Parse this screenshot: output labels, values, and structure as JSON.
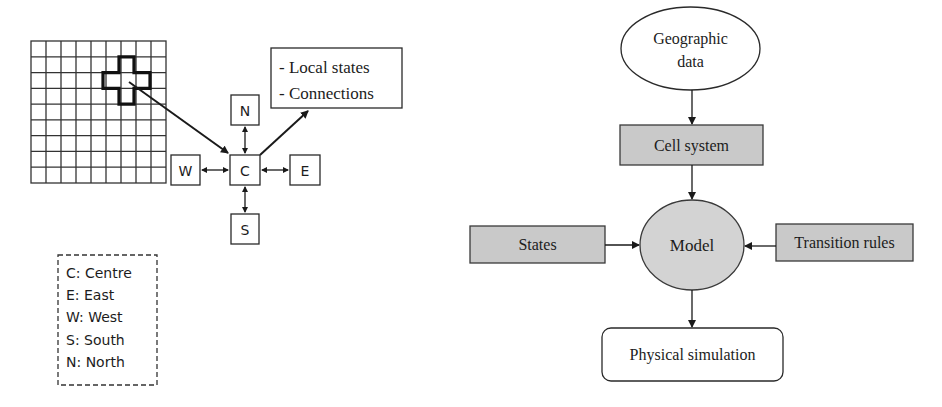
{
  "left_diagram": {
    "grid": {
      "columns": 9,
      "rows": 9,
      "highlight_center": {
        "column": 7,
        "row": 3
      },
      "highlight_shape": "plus"
    },
    "info_box": {
      "lines": [
        "- Local states",
        "- Connections"
      ]
    },
    "neighbourhood": {
      "centre": "C",
      "north": "N",
      "south": "S",
      "east": "E",
      "west": "W"
    },
    "legend": {
      "items": [
        "C: Centre",
        "E: East",
        "W: West",
        "S: South",
        "N: North"
      ]
    }
  },
  "right_diagram": {
    "nodes": {
      "geographic_data": {
        "line1": "Geographic",
        "line2": "data",
        "shape": "ellipse"
      },
      "cell_system": {
        "label": "Cell system",
        "shape": "rectangle",
        "fill": "#c9c9c9"
      },
      "states": {
        "label": "States",
        "shape": "rectangle",
        "fill": "#c9c9c9"
      },
      "model": {
        "label": "Model",
        "shape": "circle",
        "fill": "#d2d2d2"
      },
      "transition_rules": {
        "label": "Transition rules",
        "shape": "rectangle",
        "fill": "#c9c9c9"
      },
      "physical_simulation": {
        "label": "Physical simulation",
        "shape": "rounded-rectangle"
      }
    },
    "edges": [
      [
        "Geographic data",
        "Cell system"
      ],
      [
        "Cell system",
        "Model"
      ],
      [
        "States",
        "Model"
      ],
      [
        "Transition rules",
        "Model"
      ],
      [
        "Model",
        "Physical simulation"
      ]
    ]
  }
}
